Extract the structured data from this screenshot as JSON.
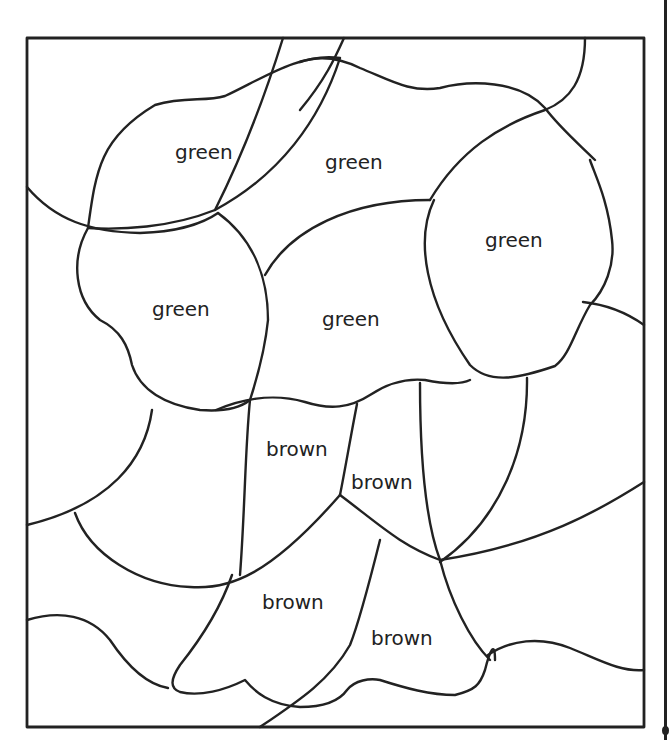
{
  "page": {
    "cutoff_header_text": "",
    "line_color": "#222222",
    "background": "#ffffff"
  },
  "regions": [
    {
      "label": "green",
      "x": 175,
      "y": 140
    },
    {
      "label": "green",
      "x": 325,
      "y": 150
    },
    {
      "label": "green",
      "x": 485,
      "y": 228
    },
    {
      "label": "green",
      "x": 152,
      "y": 297
    },
    {
      "label": "green",
      "x": 322,
      "y": 307
    },
    {
      "label": "brown",
      "x": 266,
      "y": 437
    },
    {
      "label": "brown",
      "x": 351,
      "y": 470
    },
    {
      "label": "brown",
      "x": 262,
      "y": 590
    },
    {
      "label": "brown",
      "x": 371,
      "y": 626
    }
  ]
}
